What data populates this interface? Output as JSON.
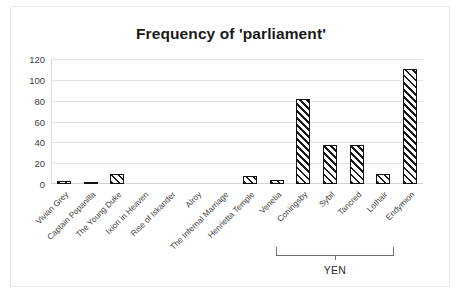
{
  "chart_data": {
    "type": "bar",
    "title": "Frequency of 'parliament'",
    "xlabel": "",
    "ylabel": "",
    "ylim": [
      0,
      120
    ],
    "yticks": [
      0,
      20,
      40,
      60,
      80,
      100,
      120
    ],
    "grid": true,
    "legend": false,
    "categories": [
      "Vivian Grey",
      "Captain Popanilla",
      "The Young Duke",
      "Ixion in Heaven",
      "Rise of Iskander",
      "Alroy",
      "The Infernal Marriage",
      "Henrietta Temple",
      "Venetia",
      "Coningsby",
      "Sybil",
      "Tancred",
      "Lothair",
      "Endymion"
    ],
    "values": [
      3,
      2,
      10,
      0,
      0,
      0,
      0,
      8,
      4,
      82,
      37,
      37,
      10,
      110
    ],
    "annotations": [
      {
        "label": "YEN",
        "type": "bracket",
        "spans": [
          "Coningsby",
          "Sybil",
          "Tancred"
        ]
      }
    ]
  },
  "axis": {
    "tick_0": "0",
    "tick_20": "20",
    "tick_40": "40",
    "tick_60": "60",
    "tick_80": "80",
    "tick_100": "100",
    "tick_120": "120"
  },
  "colors": {
    "bar_outline": "#111111",
    "bar_hatch": "#1a1a1a",
    "gridline": "#e3e3e3",
    "text": "#3d3d3d",
    "title": "#1a1a1a",
    "frame": "#e8e8e8"
  }
}
